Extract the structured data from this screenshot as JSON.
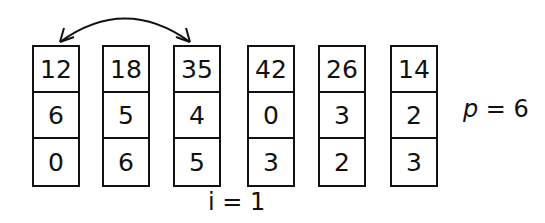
{
  "diagram": {
    "columns": [
      {
        "values": [
          "12",
          "6",
          "0"
        ],
        "left": 32
      },
      {
        "values": [
          "18",
          "5",
          "6"
        ],
        "left": 102
      },
      {
        "values": [
          "35",
          "4",
          "5"
        ],
        "left": 173
      },
      {
        "values": [
          "42",
          "0",
          "3"
        ],
        "left": 247
      },
      {
        "values": [
          "26",
          "3",
          "2"
        ],
        "left": 318
      },
      {
        "values": [
          "14",
          "2",
          "3"
        ],
        "left": 390
      }
    ],
    "swap_arrow": {
      "from_column": 0,
      "to_column": 2,
      "description": "double-headed curved arrow between column 1 and column 3"
    },
    "index_label": "i = 1",
    "p_label_var": "p",
    "p_label_rest": " = 6"
  }
}
